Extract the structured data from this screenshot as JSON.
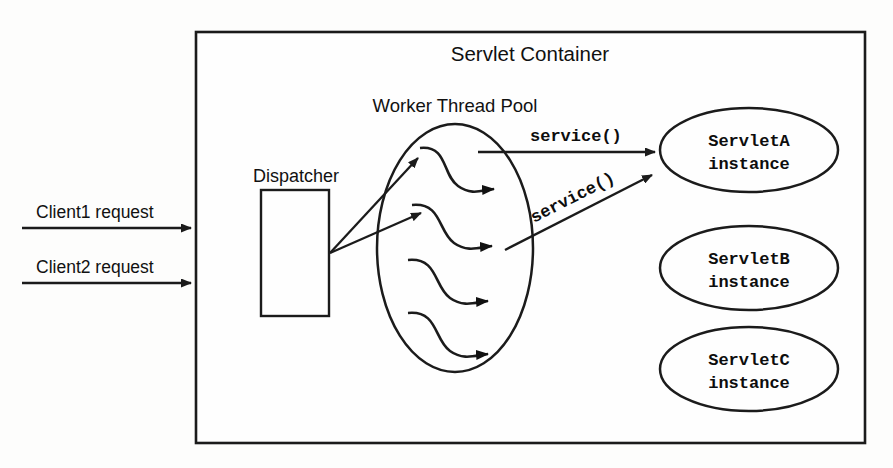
{
  "diagram": {
    "container": {
      "title": "Servlet Container"
    },
    "pool": {
      "title": "Worker Thread Pool",
      "thread_count": 4
    },
    "dispatcher": {
      "label": "Dispatcher"
    },
    "client_requests": [
      {
        "label": "Client1 request"
      },
      {
        "label": "Client2 request"
      }
    ],
    "service_calls": [
      {
        "label": "service()"
      },
      {
        "label": "service()"
      }
    ],
    "servlets": [
      {
        "name": "ServletA",
        "kind": "instance"
      },
      {
        "name": "ServletB",
        "kind": "instance"
      },
      {
        "name": "ServletC",
        "kind": "instance"
      }
    ],
    "colors": {
      "ink": "#1b1b1b",
      "paper": "#fdfdfc",
      "shape_fill": "#fefefe"
    }
  }
}
